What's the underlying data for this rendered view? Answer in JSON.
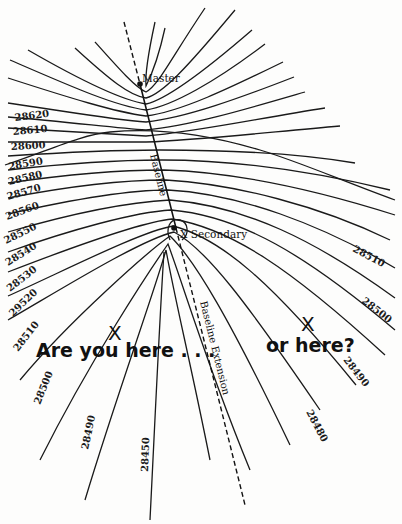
{
  "diagram": {
    "type": "loran-hyperbolic-lines-of-position",
    "stations": {
      "master": "Master",
      "secondary": "X Secondary"
    },
    "axis_labels": {
      "baseline": "Baseline",
      "baseline_extension": "Baseline Extension"
    },
    "left_lop_labels": [
      "28620",
      "28610",
      "28600",
      "28590",
      "28580",
      "28570",
      "28560",
      "28550",
      "28540",
      "28530",
      "29520",
      "28510"
    ],
    "right_lop_labels": [
      "28510",
      "28500",
      "28490",
      "28480"
    ],
    "bottom_lop_labels": [
      "28500",
      "28490",
      "28450"
    ],
    "annotations": {
      "position_a_marker": "X",
      "position_a_text": "Are you here . . .",
      "position_b_marker": "X",
      "position_b_text": "or here?"
    }
  }
}
